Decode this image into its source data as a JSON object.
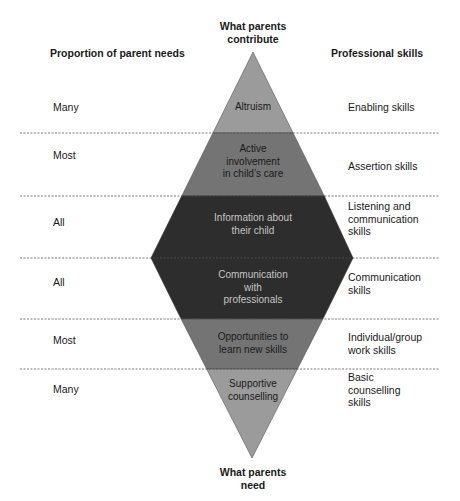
{
  "headers": {
    "left": "Proportion of parent needs",
    "top_center": [
      "What parents",
      "contribute"
    ],
    "right": "Professional skills",
    "bottom_center": [
      "What parents",
      "need"
    ]
  },
  "rows": [
    {
      "proportion": "Many",
      "parent_item": [
        "Altruism"
      ],
      "skill": [
        "Enabling skills"
      ],
      "fill": "#9b9b9b",
      "text_color": "#1a1a1a"
    },
    {
      "proportion": "Most",
      "parent_item": [
        "Active",
        "involvement",
        "in child’s care"
      ],
      "skill": [
        "Assertion skills"
      ],
      "fill": "#747474",
      "text_color": "#1a1a1a"
    },
    {
      "proportion": "All",
      "parent_item": [
        "Information about",
        "their child"
      ],
      "skill": [
        "Listening and",
        "communication",
        "skills"
      ],
      "fill": "#2d2d2d",
      "text_color": "#c4c4c4"
    },
    {
      "proportion": "All",
      "parent_item": [
        "Communication",
        "with",
        "professionals"
      ],
      "skill": [
        "Communication",
        "skills"
      ],
      "fill": "#2d2d2d",
      "text_color": "#c4c4c4"
    },
    {
      "proportion": "Most",
      "parent_item": [
        "Opportunities to",
        "learn new skills"
      ],
      "skill": [
        "Individual/group",
        "work skills"
      ],
      "fill": "#747474",
      "text_color": "#1a1a1a"
    },
    {
      "proportion": "Many",
      "parent_item": [
        "Supportive",
        "counselling"
      ],
      "skill": [
        "Basic",
        "counselling",
        "skills"
      ],
      "fill": "#9b9b9b",
      "text_color": "#1a1a1a"
    }
  ],
  "colors": {
    "light_band": "#9b9b9b",
    "mid_band": "#747474",
    "dark_band": "#2d2d2d",
    "divider": "#555555"
  }
}
